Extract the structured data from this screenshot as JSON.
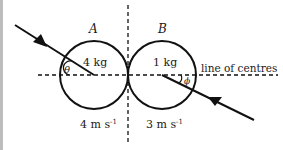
{
  "diagram": {
    "sphere_a": {
      "label": "A",
      "mass": "4 kg",
      "speed": "4 m s",
      "speed_exp": "-1",
      "angle_label": "θ"
    },
    "sphere_b": {
      "label": "B",
      "mass": "1 kg",
      "speed": "3 m s",
      "speed_exp": "-1",
      "angle_label": "ϕ"
    },
    "line_label": "line of centres",
    "colors": {
      "stroke": "#111111",
      "background": "#ffffff",
      "border": "#bdbdbd"
    }
  }
}
